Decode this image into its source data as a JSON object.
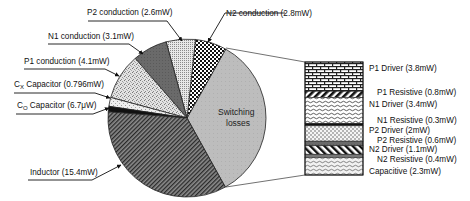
{
  "chart_data": {
    "type": "pie",
    "title": "",
    "subtitle": "Pie of power-loss breakdown with bar-of-pie expansion of switching losses",
    "unit": "mW",
    "pie": {
      "slices": [
        {
          "label": "Switching losses",
          "value": 14.7,
          "pattern": "light-gray",
          "expanded": true
        },
        {
          "label": "N2 conduction",
          "value": 2.8,
          "pattern": "checker"
        },
        {
          "label": "P2 conduction",
          "value": 2.6,
          "pattern": "fine-dots"
        },
        {
          "label": "N1 conduction",
          "value": 3.1,
          "pattern": "dark-gray"
        },
        {
          "label": "P1 conduction",
          "value": 4.1,
          "pattern": "speckle"
        },
        {
          "label": "Cx Capacitor",
          "value": 0.796,
          "pattern": "light-speckle"
        },
        {
          "label": "Co Capacitor",
          "value": 0.0067,
          "pattern": "black"
        },
        {
          "label": "Inductor",
          "value": 15.4,
          "pattern": "diagonal-dense"
        }
      ]
    },
    "bar": {
      "title": "Switching losses",
      "segments": [
        {
          "label": "P1 Driver",
          "value": 3.8,
          "pattern": "brick"
        },
        {
          "label": "P1 Resistive",
          "value": 0.8,
          "pattern": "diagonal-bold"
        },
        {
          "label": "N1 Driver",
          "value": 3.4,
          "pattern": "wave"
        },
        {
          "label": "N1 Resistive",
          "value": 0.3,
          "pattern": "black"
        },
        {
          "label": "P2 Driver",
          "value": 2.0,
          "pattern": "dots"
        },
        {
          "label": "P2 Resistive",
          "value": 0.6,
          "pattern": "dark-gray"
        },
        {
          "label": "N2 Driver",
          "value": 1.1,
          "pattern": "diagonal-back"
        },
        {
          "label": "N2 Resistive",
          "value": 0.4,
          "pattern": "gray"
        },
        {
          "label": "Capacitive",
          "value": 2.3,
          "pattern": "wave-light"
        }
      ]
    },
    "legend_position": "none (callout labels)",
    "grid": false
  },
  "labels": {
    "p2_conduction": "P2 conduction (2.6mW)",
    "n2_conduction": "N2 conduction (2.8mW)",
    "n1_conduction": "N1 conduction (3.1mW)",
    "p1_conduction": "P1 conduction (4.1mW)",
    "cx_prefix": "C",
    "cx_sub": "X",
    "cx_rest": " Capacitor (0.796mW)",
    "co_prefix": "C",
    "co_sub": "O",
    "co_rest": " Capacitor (6.7μW)",
    "inductor": "Inductor (15.4mW)",
    "switching_line1": "Switching",
    "switching_line2": "losses",
    "bar": {
      "p1_driver": "P1 Driver (3.8mW)",
      "p1_resistive": "P1 Resistive (0.8mW)",
      "n1_driver": "N1 Driver (3.4mW)",
      "n1_resistive": "N1 Resistive (0.3mW)",
      "p2_driver": "P2 Driver (2mW)",
      "p2_resistive": "P2 Resistive (0.6mW)",
      "n2_driver": "N2 Driver (1.1mW)",
      "n2_resistive": "N2 Resistive (0.4mW)",
      "capacitive": "Capacitive (2.3mW)"
    }
  }
}
